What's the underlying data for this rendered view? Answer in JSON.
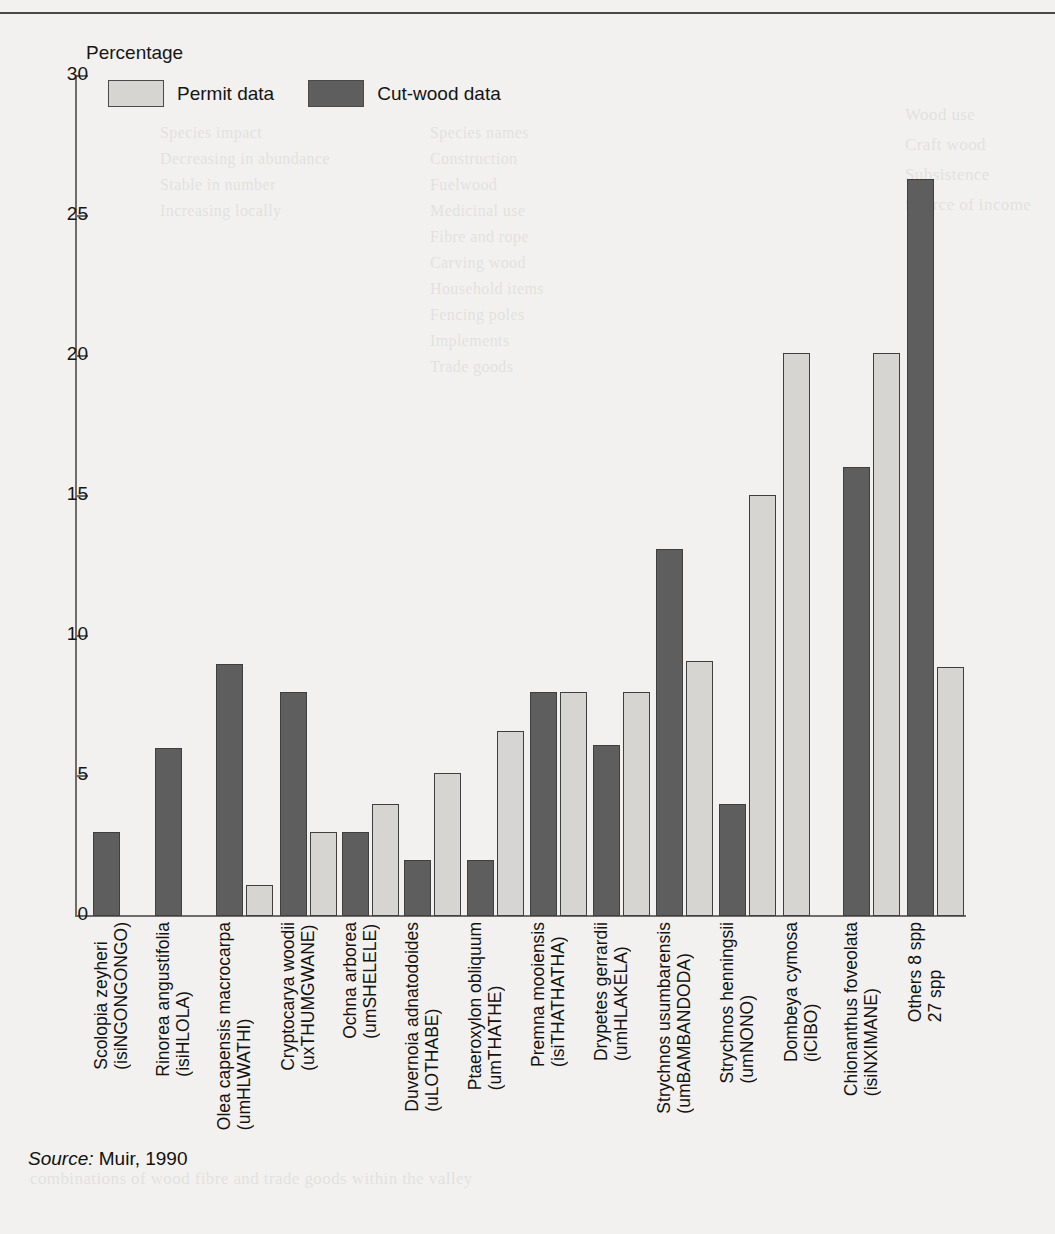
{
  "figure": {
    "axis_title": "Percentage",
    "source_prefix": "Source:",
    "source_text": "Muir, 1990"
  },
  "legend": {
    "items": [
      {
        "label": "Permit data",
        "color": "#d6d5d1",
        "swatch": "light-swatch"
      },
      {
        "label": "Cut-wood data",
        "color": "#5e5e5e",
        "swatch": "dark-swatch"
      }
    ]
  },
  "y_axis": {
    "ticks": [
      "0",
      "5",
      "10",
      "15",
      "20",
      "25",
      "30"
    ],
    "min": 0,
    "max": 30
  },
  "chart_data": {
    "type": "bar",
    "title": "Percentage",
    "xlabel": "",
    "ylabel": "Percentage",
    "ylim": [
      0,
      30
    ],
    "grid": false,
    "legend_position": "top-left",
    "categories": [
      "Scolopia zeyheri\n(isiNGONGONGO)",
      "Rinorea angustifolia\n(isiHLOLA)",
      "Olea capensis macrocarpa\n(umHLWATHI)",
      "Cryptocarya woodii\n(uxTHUMGWANE)",
      "Ochna arborea\n(umSHELELE)",
      "Duvernoia adnatodoides\n(uLOTHABE)",
      "Ptaeroxylon obliquum\n(umTHATHE)",
      "Premna mooiensis\n(isiTHATHATHA)",
      "Drypetes gerrardii\n(umHLAKELA)",
      "Strychnos usumbarensis\n(umBAMBANDODA)",
      "Strychnos henningsii\n(umNONO)",
      "Dombeya cymosa\n(iCIBO)",
      "Chionanthus foveolata\n(isiNXIMANE)",
      "Others 8 spp\n27 spp"
    ],
    "series": [
      {
        "name": "Cut-wood data",
        "color": "#5e5e5e",
        "values": [
          3.0,
          6.0,
          9.0,
          8.0,
          3.0,
          2.0,
          2.0,
          8.0,
          6.1,
          13.1,
          4.0,
          null,
          16.0,
          26.3
        ]
      },
      {
        "name": "Permit data",
        "color": "#d6d5d1",
        "values": [
          null,
          null,
          1.1,
          3.0,
          4.0,
          5.1,
          6.6,
          8.0,
          8.0,
          9.1,
          15.0,
          20.1,
          20.1,
          8.9
        ]
      }
    ]
  },
  "bleed_text": {
    "right_column": [
      "Wood use",
      "Craft wood",
      "Subsistence and",
      "Source of income"
    ],
    "faint": "page bleed-through"
  }
}
